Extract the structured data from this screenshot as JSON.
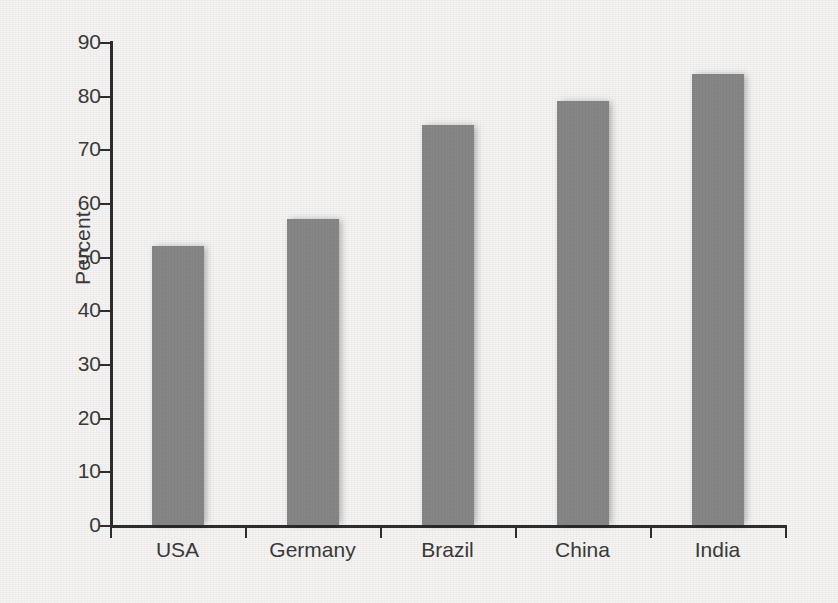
{
  "chart_data": {
    "type": "bar",
    "title": "",
    "subtitle": "",
    "xlabel": "",
    "ylabel": "Percent",
    "categories": [
      "USA",
      "Germany",
      "Brazil",
      "China",
      "India"
    ],
    "values": [
      52,
      57,
      74.5,
      79,
      84
    ],
    "series": [
      {
        "name": "Percent",
        "values": [
          52,
          57,
          74.5,
          79,
          84
        ]
      }
    ],
    "ylim": [
      0,
      90
    ],
    "yticks": [
      0,
      10,
      20,
      30,
      40,
      50,
      60,
      70,
      80,
      90
    ],
    "ytick_labels": [
      "0",
      "10",
      "20",
      "30",
      "40",
      "50",
      "60",
      "70",
      "80",
      "90"
    ],
    "grid": false,
    "legend": false,
    "legend_position": "none",
    "bar_color": "#878787",
    "axis_color": "#2e2e2e",
    "background_color": "#f6f5f3",
    "text_color": "#3a3a3a",
    "annotations": []
  }
}
